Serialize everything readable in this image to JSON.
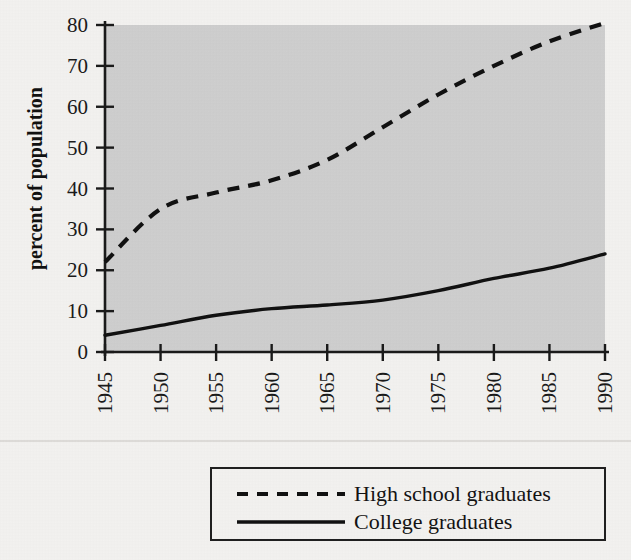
{
  "figure": {
    "background_color": "#f3f2f0",
    "plot_background_color": "#cfcfcf",
    "axis_color": "#1a1a1a",
    "series_color": "#111111",
    "separator_color": "#d9d8d6"
  },
  "axes": {
    "ylabel": "percent of population",
    "y_ticks": [
      "0",
      "10",
      "20",
      "30",
      "40",
      "50",
      "60",
      "70",
      "80"
    ],
    "x_ticks": [
      "1945",
      "1950",
      "1955",
      "1960",
      "1965",
      "1970",
      "1975",
      "1980",
      "1985",
      "1990"
    ]
  },
  "legend": {
    "position": "below-plot",
    "entries": [
      {
        "label": "High school graduates",
        "style": "dashed"
      },
      {
        "label": "College graduates",
        "style": "solid"
      }
    ]
  },
  "chart_data": {
    "type": "line",
    "title": "",
    "xlabel": "",
    "ylabel": "percent of population",
    "xlim": [
      1945,
      1990
    ],
    "ylim": [
      0,
      80
    ],
    "grid": false,
    "legend_position": "below-plot",
    "x": [
      1945,
      1950,
      1955,
      1960,
      1965,
      1970,
      1975,
      1980,
      1985,
      1990
    ],
    "xticklabels": [
      "1945",
      "1950",
      "1955",
      "1960",
      "1965",
      "1970",
      "1975",
      "1980",
      "1985",
      "1990"
    ],
    "yticks": [
      0,
      10,
      20,
      30,
      40,
      50,
      60,
      70,
      80
    ],
    "series": [
      {
        "name": "High school graduates",
        "style": "dashed",
        "values": [
          22,
          35,
          39,
          42,
          47,
          55,
          63,
          70,
          76,
          80.5
        ]
      },
      {
        "name": "College graduates",
        "style": "solid",
        "values": [
          4.1,
          6.5,
          9.0,
          10.6,
          11.5,
          12.7,
          15.0,
          18.0,
          20.5,
          24.0
        ]
      }
    ]
  }
}
